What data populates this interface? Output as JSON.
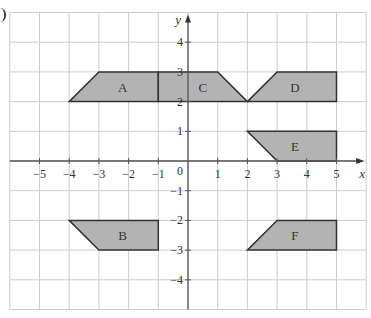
{
  "diagram": {
    "type": "coordinate-grid-shapes",
    "grid": {
      "x_range": [
        -6,
        6
      ],
      "y_range": [
        -5,
        5
      ],
      "origin_px": [
        188,
        161
      ],
      "cell_px": 29.7,
      "line_color": "#cccccc",
      "axis_color": "#555555"
    },
    "axes": {
      "x_label": "x",
      "y_label": "y",
      "origin_label": "0",
      "x_ticks": [
        "−5",
        "−4",
        "−3",
        "−2",
        "−1",
        "1",
        "2",
        "3",
        "4",
        "5"
      ],
      "x_tick_values": [
        -5,
        -4,
        -3,
        -2,
        -1,
        1,
        2,
        3,
        4,
        5
      ],
      "y_ticks": [
        "4",
        "3",
        "2",
        "1",
        "−1",
        "−2",
        "−3",
        "−4"
      ],
      "y_tick_values": [
        4,
        3,
        2,
        1,
        -1,
        -2,
        -3,
        -4
      ]
    },
    "shape_fill": "#b3b3b3",
    "shape_stroke": "#333333",
    "shapes": [
      {
        "label": "A",
        "points": [
          [
            -4,
            2
          ],
          [
            -3,
            3
          ],
          [
            -1,
            3
          ],
          [
            -1,
            2
          ]
        ],
        "label_at": [
          -2.2,
          2.5
        ]
      },
      {
        "label": "C",
        "points": [
          [
            -1,
            2
          ],
          [
            -1,
            3
          ],
          [
            1,
            3
          ],
          [
            2,
            2
          ]
        ],
        "label_at": [
          0.5,
          2.5
        ]
      },
      {
        "label": "D",
        "points": [
          [
            2,
            2
          ],
          [
            3,
            3
          ],
          [
            5,
            3
          ],
          [
            5,
            2
          ]
        ],
        "label_at": [
          3.6,
          2.5
        ]
      },
      {
        "label": "E",
        "points": [
          [
            2,
            1
          ],
          [
            5,
            1
          ],
          [
            5,
            0
          ],
          [
            3,
            0
          ]
        ],
        "label_at": [
          3.6,
          0.5
        ]
      },
      {
        "label": "B",
        "points": [
          [
            -4,
            -2
          ],
          [
            -1,
            -2
          ],
          [
            -1,
            -3
          ],
          [
            -3,
            -3
          ]
        ],
        "label_at": [
          -2.2,
          -2.5
        ]
      },
      {
        "label": "F",
        "points": [
          [
            2,
            -3
          ],
          [
            3,
            -2
          ],
          [
            5,
            -2
          ],
          [
            5,
            -3
          ]
        ],
        "label_at": [
          3.6,
          -2.5
        ]
      }
    ]
  }
}
